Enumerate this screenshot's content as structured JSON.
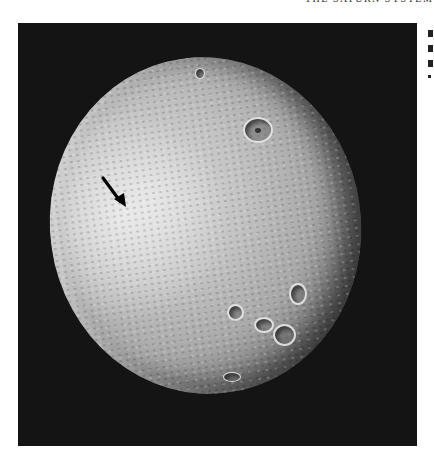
{
  "page": {
    "running_head": "THE SATURN SYSTEM"
  },
  "figure": {
    "background_color": "#141414",
    "surface_color": "#c4c4c4",
    "annotations": [
      {
        "type": "arrow",
        "direction": "down-right",
        "color": "#000000"
      }
    ],
    "features": [
      {
        "name": "large-crater-north",
        "kind": "crater"
      },
      {
        "name": "crater-cluster-southeast",
        "kind": "crater-group"
      }
    ]
  },
  "right_column": {
    "fragments": [
      "",
      "",
      "",
      ""
    ]
  }
}
